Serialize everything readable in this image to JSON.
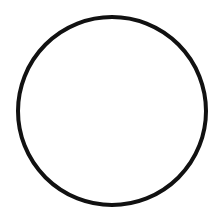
{
  "canvas": {
    "width": 224,
    "height": 214,
    "background": "#ffffff"
  },
  "shape": {
    "type": "circle",
    "cx": 112,
    "cy": 111,
    "r": 94,
    "stroke": "#111111",
    "stroke_width": 4,
    "fill": "none"
  }
}
